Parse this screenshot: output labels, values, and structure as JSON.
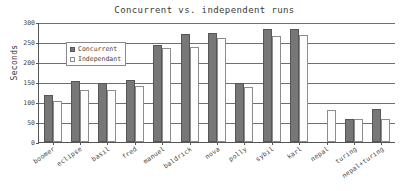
{
  "chart_data": {
    "type": "bar",
    "title": "Concurrent vs. independent runs",
    "xlabel": "",
    "ylabel": "Seconds",
    "ylim": [
      0,
      300
    ],
    "yticks": [
      0,
      50,
      100,
      150,
      200,
      250,
      300
    ],
    "grid": true,
    "legend_position": "upper-left-inside",
    "categories": [
      "boomer",
      "eclipse",
      "basil",
      "fred",
      "manuel",
      "baldrick",
      "nova",
      "polly",
      "sybil",
      "karl",
      "nepal",
      "turing",
      "nepal+turing"
    ],
    "series": [
      {
        "name": "Concurrent",
        "color": "#777777",
        "values": [
          118,
          152,
          147,
          155,
          242,
          270,
          272,
          147,
          282,
          282,
          0,
          57,
          83
        ]
      },
      {
        "name": "Independant",
        "color": "#ffffff",
        "values": [
          102,
          129,
          131,
          139,
          236,
          237,
          260,
          137,
          265,
          267,
          81,
          57,
          57
        ]
      }
    ]
  },
  "legend": {
    "items": [
      {
        "label": "Concurrent"
      },
      {
        "label": "Independant"
      }
    ]
  }
}
